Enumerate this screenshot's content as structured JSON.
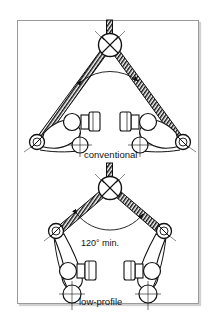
{
  "figure": {
    "background_color": "#ffffff",
    "ink_color": "#111111",
    "border_color": "#9a9a9a",
    "title": "",
    "border": {
      "x": 17,
      "y": 20,
      "width": 182,
      "height": 284
    }
  },
  "diagram_data": {
    "type": "technical-line-drawing",
    "subject": "bicycle cantilever brake arm geometry comparison",
    "panels": [
      {
        "id": "conventional",
        "label": "conventional",
        "label_position": {
          "x": 84,
          "y": 155
        },
        "yoke": {
          "cx": 110,
          "cy": 45,
          "r": 11,
          "marker": "circle-with-x"
        },
        "main_cable": {
          "x1": 110,
          "y1": 21,
          "x2": 110,
          "y2": 34,
          "style": "hatched"
        },
        "straddle_left": {
          "x1": 103,
          "y1": 53,
          "x2": 37,
          "y2": 141,
          "style": "hatched"
        },
        "straddle_right": {
          "x1": 117,
          "y1": 53,
          "x2": 183,
          "y2": 141,
          "style": "hatched"
        },
        "angle_arc": {
          "cx": 110,
          "cy": 45,
          "r": 46,
          "start_deg": 127,
          "end_deg": 53,
          "arrowheads": "both"
        },
        "angle_value": "",
        "arm_style": "wide / low-angle",
        "left_arm": {
          "cable_anchor": {
            "cx": 37,
            "cy": 142,
            "r": 7,
            "marker": "circle-with-slash"
          },
          "pad_pivot": {
            "cx": 72,
            "cy": 122,
            "r": 8
          },
          "pad_block": {
            "x": 82,
            "y": 115,
            "width": 8,
            "height": 13
          },
          "pad_end": {
            "x": 90,
            "y": 113,
            "width": 10,
            "height": 17
          },
          "mount_pivot": {
            "cx": 80,
            "cy": 145,
            "r": 8,
            "marker": "crosshair-circle"
          }
        },
        "right_arm": {
          "cable_anchor": {
            "cx": 183,
            "cy": 142,
            "r": 7,
            "marker": "circle-with-slash"
          },
          "pad_pivot": {
            "cx": 148,
            "cy": 122,
            "r": 8
          },
          "pad_block": {
            "x": 130,
            "y": 115,
            "width": 8,
            "height": 13
          },
          "pad_end": {
            "x": 120,
            "y": 113,
            "width": 10,
            "height": 17
          },
          "mount_pivot": {
            "cx": 140,
            "cy": 145,
            "r": 8,
            "marker": "crosshair-circle"
          }
        }
      },
      {
        "id": "low-profile",
        "label": "low-profile",
        "label_position": {
          "x": 80,
          "y": 302
        },
        "yoke": {
          "cx": 110,
          "cy": 188,
          "r": 11,
          "marker": "circle-with-x"
        },
        "main_cable": {
          "x1": 110,
          "y1": 165,
          "x2": 110,
          "y2": 177,
          "style": "hatched"
        },
        "straddle_left": {
          "x1": 101,
          "y1": 196,
          "x2": 57,
          "y2": 231,
          "style": "hatched"
        },
        "straddle_right": {
          "x1": 119,
          "y1": 196,
          "x2": 163,
          "y2": 231,
          "style": "hatched"
        },
        "angle_arc": {
          "cx": 110,
          "cy": 188,
          "r": 42,
          "start_deg": 142,
          "end_deg": 38,
          "arrowheads": "both"
        },
        "angle_value": "120° min.",
        "angle_label_position": {
          "x": 82,
          "y": 243
        },
        "arm_style": "upright / low-profile",
        "left_arm": {
          "cable_anchor": {
            "cx": 56,
            "cy": 231,
            "r": 7,
            "marker": "circle-with-slash"
          },
          "pad_pivot": {
            "cx": 68,
            "cy": 272,
            "r": 8
          },
          "pad_block": {
            "x": 78,
            "y": 265,
            "width": 8,
            "height": 13
          },
          "pad_end": {
            "x": 86,
            "y": 263,
            "width": 10,
            "height": 17
          },
          "mount_pivot": {
            "cx": 72,
            "cy": 294,
            "r": 9,
            "marker": "crosshair-circle"
          }
        },
        "right_arm": {
          "cable_anchor": {
            "cx": 164,
            "cy": 231,
            "r": 7,
            "marker": "circle-with-slash"
          },
          "pad_pivot": {
            "cx": 152,
            "cy": 272,
            "r": 8
          },
          "pad_block": {
            "x": 134,
            "y": 265,
            "width": 8,
            "height": 13
          },
          "pad_end": {
            "x": 124,
            "y": 263,
            "width": 10,
            "height": 17
          },
          "mount_pivot": {
            "cx": 148,
            "cy": 294,
            "r": 9,
            "marker": "crosshair-circle"
          }
        }
      }
    ],
    "annotations": [
      {
        "text": "conventional",
        "x": 84,
        "y": 155
      },
      {
        "text": "120° min.",
        "x": 82,
        "y": 243
      },
      {
        "text": "low-profile",
        "x": 80,
        "y": 302
      }
    ]
  }
}
